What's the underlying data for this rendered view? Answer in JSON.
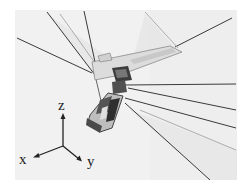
{
  "figure": {
    "axes": {
      "z_label": "z",
      "x_label": "x",
      "y_label": "y"
    }
  }
}
